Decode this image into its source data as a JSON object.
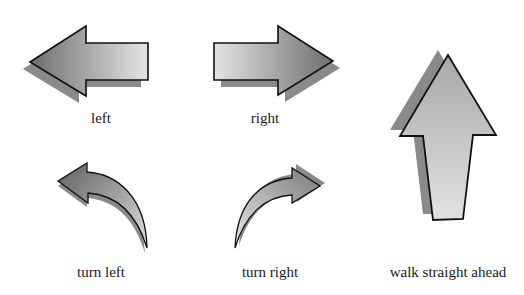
{
  "figure": {
    "labels": {
      "left": "left",
      "right": "right",
      "turn_left": "turn left",
      "turn_right": "turn right",
      "walk_straight_ahead": "walk straight ahead"
    },
    "icons": [
      {
        "name": "arrow-left-icon",
        "label_key": "left"
      },
      {
        "name": "arrow-right-icon",
        "label_key": "right"
      },
      {
        "name": "arrow-up-icon",
        "label_key": "walk_straight_ahead"
      },
      {
        "name": "curved-arrow-left-icon",
        "label_key": "turn_left"
      },
      {
        "name": "curved-arrow-right-icon",
        "label_key": "turn_right"
      }
    ],
    "colors": {
      "shadow": "#8a8a8a",
      "outline": "#111111",
      "gradient_dark": "#6e6e6e",
      "gradient_light": "#e6e6e6",
      "text": "#1a1a1a",
      "background": "#ffffff"
    }
  }
}
